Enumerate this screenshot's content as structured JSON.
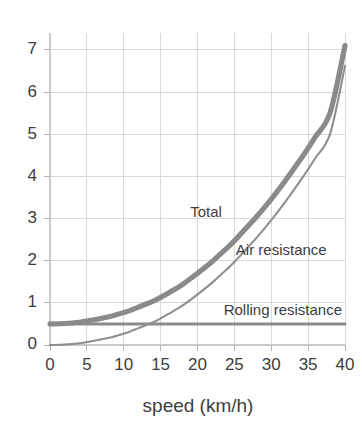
{
  "chart_data": {
    "type": "line",
    "title": "",
    "subtitle": "",
    "xlabel": "speed (km/h)",
    "ylabel": "",
    "xlim": [
      0,
      40
    ],
    "ylim": [
      0,
      7.4
    ],
    "grid": true,
    "legend_position": "inline-annotations",
    "xticks": [
      "0",
      "5",
      "10",
      "15",
      "20",
      "25",
      "30",
      "35",
      "40"
    ],
    "xtick_values": [
      0,
      5,
      10,
      15,
      20,
      25,
      30,
      35,
      40
    ],
    "yticks": [
      "0",
      "1",
      "2",
      "3",
      "4",
      "5",
      "6",
      "7"
    ],
    "ytick_values": [
      0,
      1,
      2,
      3,
      4,
      5,
      6,
      7
    ],
    "x": [
      0,
      2,
      4,
      5,
      6,
      8,
      10,
      11,
      12,
      14,
      15,
      16,
      18,
      20,
      22,
      24,
      25,
      26,
      28,
      30,
      32,
      34,
      35,
      36,
      38,
      40
    ],
    "series": [
      {
        "name": "Total",
        "label": "Total",
        "color": "#8a8a8a",
        "width": 5.2,
        "values": [
          0.5,
          0.51,
          0.54,
          0.57,
          0.6,
          0.67,
          0.77,
          0.83,
          0.9,
          1.04,
          1.13,
          1.23,
          1.44,
          1.7,
          1.98,
          2.3,
          2.47,
          2.66,
          3.04,
          3.46,
          3.92,
          4.41,
          4.67,
          4.94,
          5.52,
          7.1
        ],
        "annotation": {
          "text": "Total",
          "x": 19.0,
          "y": 3.12
        }
      },
      {
        "name": "Air resistance",
        "label": "Air resistance",
        "color": "#8f8f8f",
        "width": 2.1,
        "values": [
          0.0,
          0.01,
          0.04,
          0.07,
          0.1,
          0.17,
          0.27,
          0.33,
          0.4,
          0.54,
          0.63,
          0.73,
          0.94,
          1.2,
          1.48,
          1.8,
          1.97,
          2.16,
          2.54,
          2.96,
          3.42,
          3.91,
          4.17,
          4.44,
          5.02,
          6.62
        ],
        "annotation": {
          "text": "Air resistance",
          "x": 25.2,
          "y": 2.24
        }
      },
      {
        "name": "Rolling resistance",
        "label": "Rolling resistance",
        "color": "#8a8a8a",
        "width": 3.0,
        "values": [
          0.5,
          0.5,
          0.5,
          0.5,
          0.5,
          0.5,
          0.5,
          0.5,
          0.5,
          0.5,
          0.5,
          0.5,
          0.5,
          0.5,
          0.5,
          0.5,
          0.5,
          0.5,
          0.5,
          0.5,
          0.5,
          0.5,
          0.5,
          0.5,
          0.5,
          0.5
        ],
        "annotation": {
          "text": "Rolling resistance",
          "x": 39.6,
          "y": 0.8
        }
      }
    ]
  },
  "colors": {
    "background": "#ffffff",
    "grid": "#d8d8d8",
    "axis": "#c9c9c9",
    "text": "#3d3d3d",
    "total": "#8a8a8a",
    "air": "#8f8f8f",
    "rolling": "#8a8a8a"
  }
}
